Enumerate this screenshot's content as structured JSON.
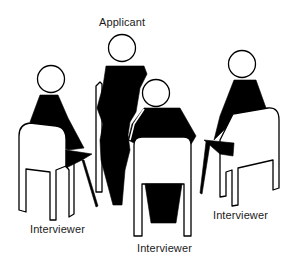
{
  "diagram": {
    "title": "",
    "type": "interview-seating-arrangement",
    "colors": {
      "ink": "#000000",
      "background": "#ffffff"
    },
    "labels": {
      "applicant": "Applicant",
      "interviewer_left": "Interviewer",
      "interviewer_center": "Interviewer",
      "interviewer_right": "Interviewer"
    },
    "figures": [
      {
        "role": "Applicant",
        "pose": "standing",
        "position": "back-center",
        "facing": "viewer"
      },
      {
        "role": "Interviewer",
        "pose": "seated",
        "position": "left",
        "facing": "applicant"
      },
      {
        "role": "Interviewer",
        "pose": "seated",
        "position": "front-center",
        "facing": "applicant"
      },
      {
        "role": "Interviewer",
        "pose": "seated",
        "position": "right",
        "facing": "applicant"
      }
    ]
  }
}
